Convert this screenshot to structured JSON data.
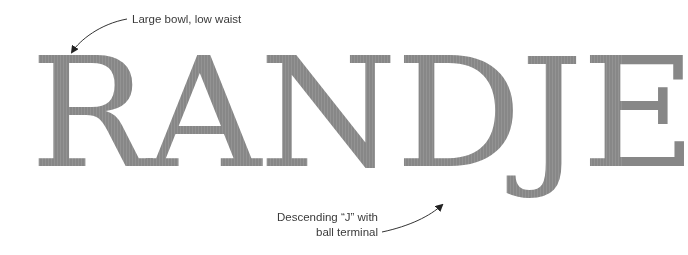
{
  "specimen": {
    "word": "RANDJE",
    "letters": [
      "R",
      "A",
      "N",
      "D",
      "J",
      "E"
    ],
    "letter_color": "#878787"
  },
  "annotations": [
    {
      "id": "bowl",
      "lines": [
        "Large bowl, low waist"
      ],
      "target_letter": "R"
    },
    {
      "id": "j-terminal",
      "lines": [
        "Descending “J” with",
        "ball terminal"
      ],
      "target_letter": "J"
    }
  ],
  "arrow_color": "#222222"
}
